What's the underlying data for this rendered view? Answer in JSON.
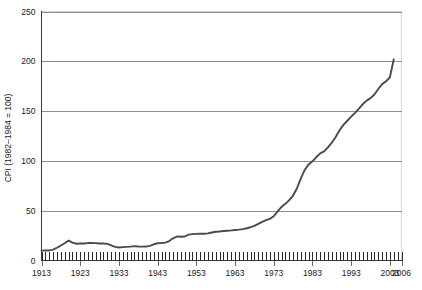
{
  "chart_data": {
    "type": "line",
    "title": "",
    "subtitle": "",
    "xlabel": "",
    "ylabel": "CPI (1982–1984 = 100)",
    "xlim": [
      1913,
      2006
    ],
    "ylim": [
      0,
      250
    ],
    "grid": "horizontal",
    "legend": "none",
    "y_ticks": [
      0,
      50,
      100,
      150,
      200,
      250
    ],
    "y_tick_labels": [
      "0",
      "50",
      "100",
      "150",
      "200",
      "250"
    ],
    "x_ticks": [
      1913,
      1923,
      1933,
      1943,
      1953,
      1963,
      1973,
      1983,
      1993,
      2003,
      2006
    ],
    "x_tick_labels": [
      "1913",
      "1923",
      "1933",
      "1943",
      "1953",
      "1963",
      "1973",
      "1983",
      "1993",
      "2003",
      "2006"
    ],
    "x_minor_tick_interval": 1,
    "series": [
      {
        "name": "CPI",
        "color": "#4a4a4a",
        "x": [
          1913,
          1914,
          1915,
          1916,
          1917,
          1918,
          1919,
          1920,
          1921,
          1922,
          1923,
          1924,
          1925,
          1926,
          1927,
          1928,
          1929,
          1930,
          1931,
          1932,
          1933,
          1934,
          1935,
          1936,
          1937,
          1938,
          1939,
          1940,
          1941,
          1942,
          1943,
          1944,
          1945,
          1946,
          1947,
          1948,
          1949,
          1950,
          1951,
          1952,
          1953,
          1954,
          1955,
          1956,
          1957,
          1958,
          1959,
          1960,
          1961,
          1962,
          1963,
          1964,
          1965,
          1966,
          1967,
          1968,
          1969,
          1970,
          1971,
          1972,
          1973,
          1974,
          1975,
          1976,
          1977,
          1978,
          1979,
          1980,
          1981,
          1982,
          1983,
          1984,
          1985,
          1986,
          1987,
          1988,
          1989,
          1990,
          1991,
          1992,
          1993,
          1994,
          1995,
          1996,
          1997,
          1998,
          1999,
          2000,
          2001,
          2002,
          2003,
          2004
        ],
        "values": [
          9.9,
          10.0,
          10.1,
          10.9,
          12.8,
          15.1,
          17.3,
          20.0,
          17.9,
          16.8,
          17.1,
          17.1,
          17.5,
          17.7,
          17.4,
          17.1,
          17.1,
          16.7,
          15.2,
          13.7,
          13.0,
          13.4,
          13.7,
          13.9,
          14.4,
          14.1,
          13.9,
          14.0,
          14.7,
          16.3,
          17.3,
          17.6,
          18.0,
          19.5,
          22.3,
          24.1,
          23.8,
          24.1,
          26.0,
          26.5,
          26.7,
          26.9,
          26.8,
          27.2,
          28.1,
          28.9,
          29.1,
          29.6,
          29.9,
          30.2,
          30.6,
          31.0,
          31.5,
          32.4,
          33.4,
          34.8,
          36.7,
          38.8,
          40.5,
          41.8,
          44.4,
          49.3,
          53.8,
          56.9,
          60.6,
          65.2,
          72.6,
          82.4,
          90.9,
          96.5,
          99.6,
          103.9,
          107.6,
          109.6,
          113.6,
          118.3,
          124.0,
          130.7,
          136.2,
          140.3,
          144.5,
          148.2,
          152.4,
          156.9,
          160.5,
          163.0,
          166.6,
          172.2,
          177.1,
          179.9,
          184.0,
          202.0
        ]
      }
    ]
  },
  "axis": {
    "y_title": "CPI (1982–1984 = 100)"
  }
}
